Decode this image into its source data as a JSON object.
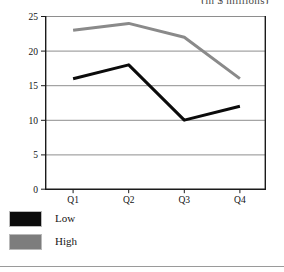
{
  "figure": {
    "clipped_title": "(in $ millions)"
  },
  "legend": {
    "items": [
      {
        "label": "Low",
        "color": "#0b0b0b"
      },
      {
        "label": "High",
        "color": "#7d7d7d"
      }
    ]
  },
  "axis": {
    "y_ticks": [
      "0",
      "5",
      "10",
      "15",
      "20",
      "25"
    ],
    "x_ticks": [
      "Q1",
      "Q2",
      "Q3",
      "Q4"
    ]
  },
  "chart_data": {
    "type": "line",
    "title": "(in $ millions)",
    "xlabel": "",
    "ylabel": "",
    "categories": [
      "Q1",
      "Q2",
      "Q3",
      "Q4"
    ],
    "series": [
      {
        "name": "Low",
        "values": [
          16,
          18,
          10,
          12
        ],
        "color": "#0b0b0b"
      },
      {
        "name": "High",
        "values": [
          23,
          24,
          22,
          16
        ],
        "color": "#8a8a8a"
      }
    ],
    "ylim": [
      0,
      25
    ],
    "ytick_step": 5,
    "grid": true,
    "grid_axis": "y",
    "legend_position": "below-left",
    "marker": "none",
    "line_width": 3
  }
}
